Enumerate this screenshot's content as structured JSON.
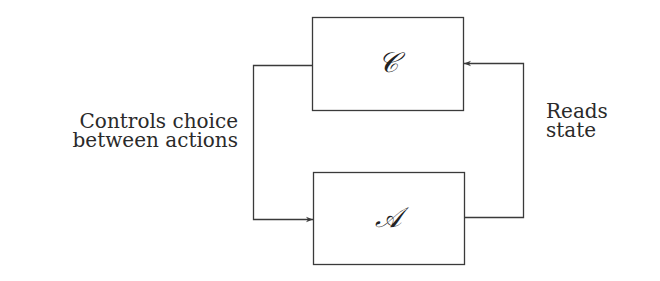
{
  "diagram": {
    "nodes": [
      {
        "id": "C",
        "symbol": "𝒞",
        "position": "top"
      },
      {
        "id": "A",
        "symbol": "𝒜",
        "position": "bottom"
      }
    ],
    "edges": [
      {
        "from": "C",
        "to": "A",
        "label": "Controls choice between actions",
        "side": "left"
      },
      {
        "from": "A",
        "to": "C",
        "label": "Reads state",
        "side": "right"
      }
    ],
    "labels": {
      "left_line1": "Controls choice",
      "left_line2": "between actions",
      "right_line1": "Reads",
      "right_line2": "state"
    },
    "colors": {
      "stroke": "#3a3a3a",
      "text": "#2a2a2a",
      "background": "#ffffff"
    }
  }
}
